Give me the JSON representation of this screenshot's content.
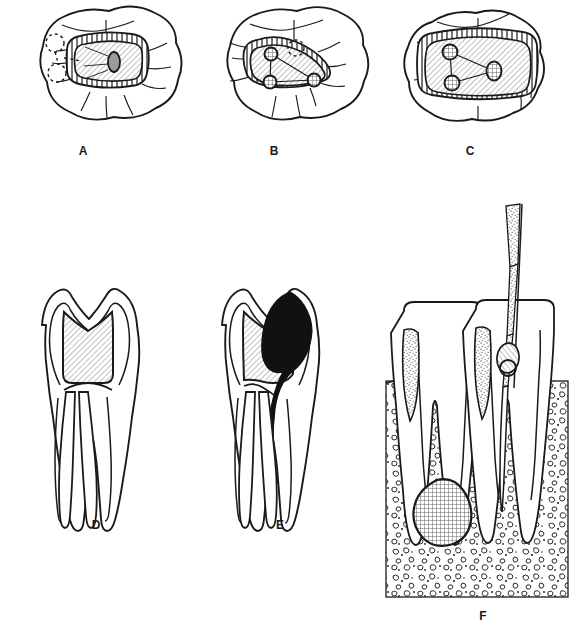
{
  "figure": {
    "background_color": "#ffffff",
    "ink_color": "#1a1a1a",
    "hatch_color": "#8a8a8a",
    "fill_light": "#e8e8e8",
    "fill_dark": "#111111",
    "panels": [
      {
        "id": "A",
        "label": "A",
        "view": "occlusal",
        "description": "Mandibular molar occlusal view with oval access cavity outline, beveled enamel margin, single oval canal orifice and dashed outlines of adjacent pit locations",
        "orifice_count": 1,
        "cavity_shape": "oval",
        "label_x": 83,
        "label_y": 150
      },
      {
        "id": "B",
        "label": "B",
        "view": "occlusal",
        "description": "Molar occlusal view with triangular access cavity outline, three canal orifices joined by connecting lines and one dashed pit outline",
        "orifice_count": 3,
        "cavity_shape": "triangular",
        "label_x": 274,
        "label_y": 150
      },
      {
        "id": "C",
        "label": "C",
        "view": "occlusal",
        "description": "Molar occlusal view with broad rectangular access cavity outline, beveled margin and three canal orifices arranged in a triangle",
        "orifice_count": 3,
        "cavity_shape": "rectangular",
        "label_x": 470,
        "label_y": 150
      },
      {
        "id": "D",
        "label": "D",
        "view": "buccolingual-section",
        "description": "Two-rooted molar longitudinal section with hatched access cavity through the crown into the pulp chamber and patent root canals",
        "label_x": 96,
        "label_y": 524
      },
      {
        "id": "E",
        "label": "E",
        "view": "buccolingual-section",
        "description": "Two-rooted molar longitudinal section with hatched access preparation and a solid black carious lesion extending down the distal surface into the canal",
        "label_x": 280,
        "label_y": 524
      },
      {
        "id": "F",
        "label": "F",
        "view": "buccolingual-section-in-bone",
        "description": "Two teeth in stippled alveolar bone with a stippled endodontic file inserted through the access into the canal, rubber stop at the reference point, and a cross-hatched periapical lesion at the root apex",
        "label_x": 483,
        "label_y": 615
      }
    ]
  },
  "caption": {
    "text": "",
    "visible": false
  }
}
